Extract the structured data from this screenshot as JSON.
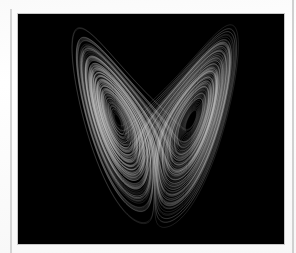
{
  "figure": {
    "view": "butterfly projection",
    "background_color": "#000000",
    "trace_color": "#e6e6e6",
    "frame_border_color": "#c8c8c8",
    "page_color": "#ffffff",
    "rule_color": "#d4d4d4"
  }
}
